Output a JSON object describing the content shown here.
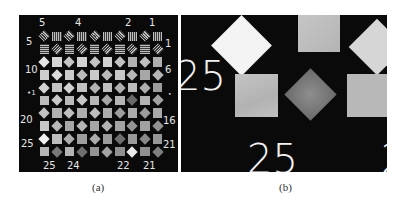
{
  "figure": {
    "panel_a": {
      "caption": "(a)",
      "top_labels": [
        "5",
        "4",
        "2",
        "1"
      ],
      "bottom_labels": [
        "25",
        "24",
        "22",
        "21"
      ],
      "left_labels": [
        "5",
        "10",
        "•1",
        "20",
        "25"
      ],
      "right_labels": [
        "1",
        "6",
        "•",
        "16",
        "21"
      ],
      "grid": {
        "rows": 10,
        "cols": 10,
        "pattern": "alternating diamonds and squares; rows 1-2 striped bar targets, rows 3-10 uniform gray patches of decreasing contrast"
      }
    },
    "panel_b": {
      "caption": "(b)",
      "left_label": "25",
      "bottom_label": "25",
      "partial_right_label": "2",
      "description": "magnified view of bottom-left corner of the target"
    }
  },
  "colors": {
    "background": "#0a0a0a",
    "label": "#e6e6e6",
    "bright_patch": "#f4f4f4",
    "gray_patch": "#c8c8c8",
    "dark_patch": "#7a7a7a"
  }
}
